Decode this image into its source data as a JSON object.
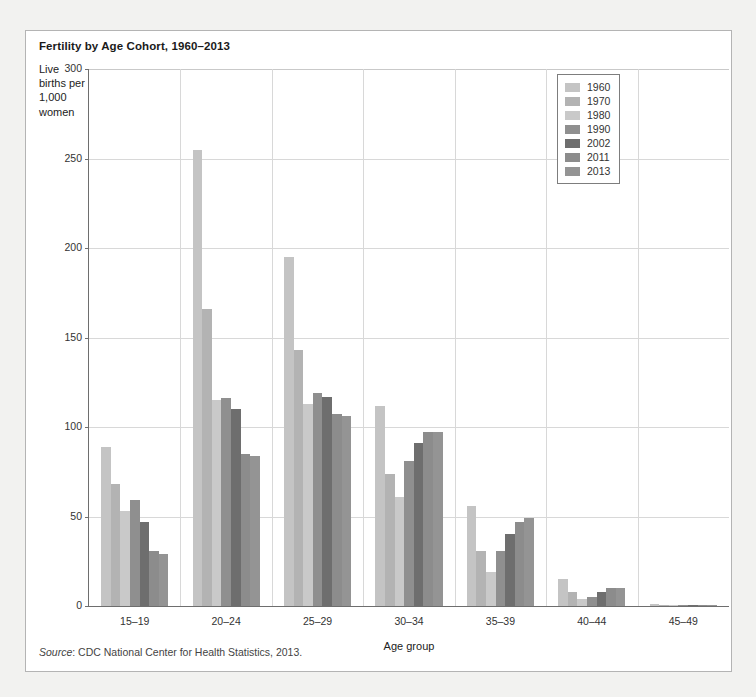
{
  "figure": {
    "title": "Fertility by Age Cohort, 1960–2013",
    "y_axis_title": "Live births per 1,000 women",
    "x_axis_title": "Age group",
    "source_prefix": "Source",
    "source_text": ": CDC National Center for Health Statistics, 2013."
  },
  "chart_data": {
    "type": "bar",
    "title": "Fertility by Age Cohort, 1960–2013",
    "xlabel": "Age group",
    "ylabel": "Live births per 1,000 women",
    "ylim": [
      0,
      300
    ],
    "yticks": [
      0,
      50,
      100,
      150,
      200,
      250,
      300
    ],
    "grid": true,
    "legend_position": "top-right",
    "categories": [
      "15–19",
      "20–24",
      "25–29",
      "30–34",
      "35–39",
      "40–44",
      "45–49"
    ],
    "series": [
      {
        "name": "1960",
        "color": "#c4c4c4",
        "values": [
          89,
          255,
          195,
          112,
          56,
          15,
          1
        ]
      },
      {
        "name": "1970",
        "color": "#b3b3b3",
        "values": [
          68,
          166,
          143,
          74,
          31,
          8,
          0.5
        ]
      },
      {
        "name": "1980",
        "color": "#c9c9c9",
        "values": [
          53,
          115,
          113,
          61,
          19,
          4,
          0.3
        ]
      },
      {
        "name": "1990",
        "color": "#8f8f8f",
        "values": [
          59,
          116,
          119,
          81,
          31,
          5,
          0.3
        ]
      },
      {
        "name": "2002",
        "color": "#6e6e6e",
        "values": [
          47,
          110,
          117,
          91,
          40,
          8,
          0.5
        ]
      },
      {
        "name": "2011",
        "color": "#8c8c8c",
        "values": [
          31,
          85,
          107,
          97,
          47,
          10,
          0.7
        ]
      },
      {
        "name": "2013",
        "color": "#949494",
        "values": [
          29,
          84,
          106,
          97,
          49,
          10,
          0.8
        ]
      }
    ]
  },
  "legend": {
    "items": [
      {
        "label": "1960",
        "color": "#c4c4c4"
      },
      {
        "label": "1970",
        "color": "#b3b3b3"
      },
      {
        "label": "1980",
        "color": "#c9c9c9"
      },
      {
        "label": "1990",
        "color": "#8f8f8f"
      },
      {
        "label": "2002",
        "color": "#6e6e6e"
      },
      {
        "label": "2011",
        "color": "#8c8c8c"
      },
      {
        "label": "2013",
        "color": "#949494"
      }
    ]
  }
}
